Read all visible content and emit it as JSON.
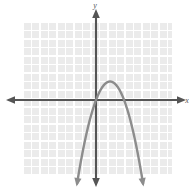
{
  "figure": {
    "width": 189,
    "height": 191,
    "background_color": "#ffffff"
  },
  "axes": {
    "x_label": "x",
    "y_label": "y",
    "axis_color": "#555555",
    "origin": {
      "x": 96,
      "y": 100
    },
    "x_axis": {
      "start_x": 7,
      "end_x": 185,
      "y": 100
    },
    "y_axis": {
      "x": 96,
      "start_y": 10,
      "end_y": 186
    },
    "arrows": [
      "left",
      "right",
      "up",
      "down"
    ]
  },
  "grid": {
    "color": "#ffffff",
    "panel_color": "#ebebeb",
    "visible": true,
    "cell_size": 8.5,
    "left": 23,
    "top": 22,
    "right": 172,
    "bottom": 175
  },
  "chart_data": {
    "type": "line",
    "xlabel": "x",
    "ylabel": "y",
    "grid": true,
    "legend": "none",
    "xlim": [
      -8.6,
      8.9
    ],
    "ylim": [
      -10.1,
      10.6
    ],
    "series": [
      {
        "name": "parabola",
        "shape": "downward-opening parabola",
        "color": "#8c8c8c",
        "line_width": 2.4,
        "vertex": {
          "x": 1.65,
          "y": 2.5
        },
        "x_intercepts": [
          0.0,
          3.3
        ],
        "y_intercept": 0.0,
        "leading_coefficient": -0.92,
        "equation": "y = -0.92(x - 1.65)^2 + 2.5",
        "x": [
          -0.2,
          0.0,
          0.3,
          0.6,
          0.9,
          1.2,
          1.65,
          2.1,
          2.4,
          2.7,
          3.0,
          3.3,
          3.6,
          3.9,
          4.2,
          4.5,
          4.8,
          5.1,
          5.4
        ],
        "y": [
          -0.9,
          0.0,
          0.7,
          1.4,
          1.9,
          2.3,
          2.5,
          2.3,
          1.9,
          1.4,
          0.7,
          0.0,
          -1.0,
          -2.1,
          -3.4,
          -4.9,
          -6.5,
          -8.3,
          -10.2
        ],
        "arrow_ends": [
          "down-left",
          "down-right"
        ]
      }
    ]
  }
}
